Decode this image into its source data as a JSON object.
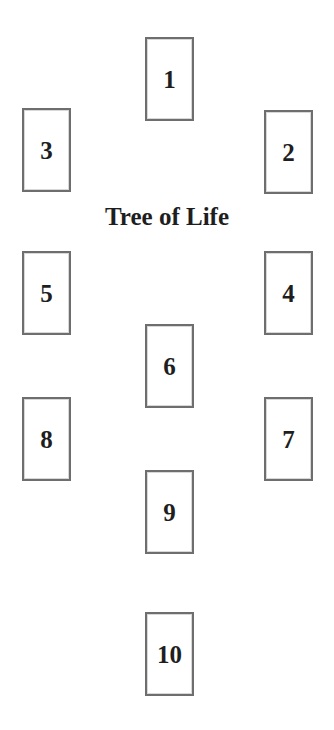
{
  "spread": {
    "title": "Tree of Life",
    "card_border_color": "#6e6e6e",
    "text_color": "#1e1e1e",
    "cards": [
      {
        "position": "1",
        "x": 145,
        "y": 37
      },
      {
        "position": "2",
        "x": 264,
        "y": 110
      },
      {
        "position": "3",
        "x": 22,
        "y": 108
      },
      {
        "position": "4",
        "x": 264,
        "y": 251
      },
      {
        "position": "5",
        "x": 22,
        "y": 251
      },
      {
        "position": "6",
        "x": 145,
        "y": 324
      },
      {
        "position": "7",
        "x": 264,
        "y": 397
      },
      {
        "position": "8",
        "x": 22,
        "y": 397
      },
      {
        "position": "9",
        "x": 145,
        "y": 470
      },
      {
        "position": "10",
        "x": 145,
        "y": 612
      }
    ]
  }
}
